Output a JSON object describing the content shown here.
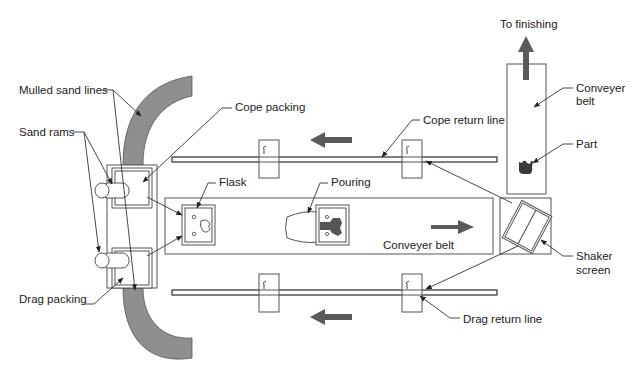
{
  "colors": {
    "line": "#444444",
    "sand_fill": "#8a8a8a",
    "arrow_fill": "#5a5a5a",
    "background": "#ffffff"
  },
  "labels": {
    "mulled_sand_lines": "Mulled sand lines",
    "sand_rams": "Sand rams",
    "cope_packing": "Cope packing",
    "drag_packing": "Drag packing",
    "flask": "Flask",
    "pouring": "Pouring",
    "conveyer_belt_main": "Conveyer belt",
    "cope_return_line": "Cope return line",
    "drag_return_line": "Drag return line",
    "to_finishing": "To finishing",
    "conveyer_belt_finish_1": "Conveyer",
    "conveyer_belt_finish_2": "belt",
    "part": "Part",
    "shaker_screen_1": "Shaker",
    "shaker_screen_2": "screen"
  },
  "flow_arrows": [
    {
      "id": "cope-return-direction",
      "direction": "left"
    },
    {
      "id": "drag-return-direction",
      "direction": "left"
    },
    {
      "id": "main-conveyer-direction",
      "direction": "right"
    },
    {
      "id": "to-finishing-direction",
      "direction": "up"
    }
  ]
}
